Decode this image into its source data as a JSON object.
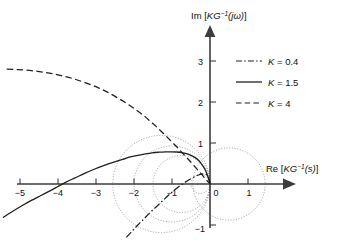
{
  "figure": {
    "name": "inverse-nyquist-plot",
    "background": "#ffffff",
    "ink": "#1a1a1a",
    "grid_color": "#8a8a8a"
  },
  "axes": {
    "x_label_parts": {
      "prefix": "Re [",
      "sym": "KG",
      "exp": "−1",
      "arg": "(s)",
      "suffix": "]"
    },
    "y_label_parts": {
      "prefix": "Im [",
      "sym": "KG",
      "exp": "−1",
      "arg": "(jω)",
      "suffix": "]"
    },
    "x_label": "Re [KG⁻¹(s)]",
    "y_label": "Im [KG⁻¹(jω)]",
    "x_ticks": [
      {
        "value": -5,
        "label": "−5"
      },
      {
        "value": -4,
        "label": "−4"
      },
      {
        "value": -3,
        "label": "−3"
      },
      {
        "value": -2,
        "label": "−2"
      },
      {
        "value": -1,
        "label": "−1"
      },
      {
        "value": 0,
        "label": "0"
      },
      {
        "value": 1,
        "label": "1"
      }
    ],
    "y_ticks": [
      {
        "value": 3,
        "label": "3"
      },
      {
        "value": 2,
        "label": "2"
      },
      {
        "value": 1,
        "label": "1"
      },
      {
        "value": -1,
        "label": "−1"
      }
    ],
    "xlim": [
      -5.6,
      1.9
    ],
    "ylim": [
      -1.45,
      3.55
    ],
    "origin_px": {
      "x": 210,
      "y": 184
    },
    "scale_px": {
      "x": 38.0,
      "y": 41.0
    }
  },
  "legend": {
    "position": "upper-right",
    "entries": [
      {
        "key": "K",
        "eq": " = ",
        "value": "0.4",
        "label": "K = 0.4",
        "style": "dash-dot"
      },
      {
        "key": "K",
        "eq": " = ",
        "value": "1.5",
        "label": "K = 1.5",
        "style": "solid"
      },
      {
        "key": "K",
        "eq": " = ",
        "value": "4",
        "label": "K = 4",
        "style": "dashed"
      }
    ]
  },
  "chart_data": {
    "type": "line",
    "title": "",
    "xlabel": "Re [KG⁻¹(s)]",
    "ylabel": "Im [KG⁻¹(jω)]",
    "xlim": [
      -5.6,
      1.9
    ],
    "ylim": [
      -1.45,
      3.55
    ],
    "grid": false,
    "legend_position": "upper-right",
    "series": [
      {
        "name": "K = 0.4",
        "style": "dash-dot",
        "color": "#1f1f1f",
        "points": [
          [
            -2.2,
            -1.3
          ],
          [
            -2.05,
            -1.15
          ],
          [
            -1.9,
            -1.0
          ],
          [
            -1.74,
            -0.85
          ],
          [
            -1.58,
            -0.7
          ],
          [
            -1.42,
            -0.56
          ],
          [
            -1.26,
            -0.42
          ],
          [
            -1.1,
            -0.28
          ],
          [
            -0.95,
            -0.16
          ],
          [
            -0.8,
            -0.05
          ],
          [
            -0.66,
            0.04
          ],
          [
            -0.52,
            0.12
          ],
          [
            -0.4,
            0.18
          ],
          [
            -0.3,
            0.22
          ],
          [
            -0.22,
            0.24
          ],
          [
            -0.15,
            0.245
          ],
          [
            -0.1,
            0.235
          ],
          [
            -0.06,
            0.2
          ],
          [
            -0.035,
            0.15
          ],
          [
            -0.018,
            0.09
          ],
          [
            -0.006,
            0.04
          ],
          [
            0.0,
            0.0
          ]
        ]
      },
      {
        "name": "K = 1.5",
        "style": "solid",
        "color": "#1f1f1f",
        "points": [
          [
            -5.45,
            -0.82
          ],
          [
            -5.2,
            -0.67
          ],
          [
            -4.95,
            -0.53
          ],
          [
            -4.7,
            -0.4
          ],
          [
            -4.45,
            -0.28
          ],
          [
            -4.2,
            -0.16
          ],
          [
            -4.0,
            -0.06
          ],
          [
            -3.8,
            0.04
          ],
          [
            -3.55,
            0.15
          ],
          [
            -3.3,
            0.26
          ],
          [
            -3.05,
            0.36
          ],
          [
            -2.8,
            0.45
          ],
          [
            -2.55,
            0.53
          ],
          [
            -2.3,
            0.6
          ],
          [
            -2.1,
            0.66
          ],
          [
            -1.9,
            0.7
          ],
          [
            -1.7,
            0.735
          ],
          [
            -1.52,
            0.76
          ],
          [
            -1.35,
            0.775
          ],
          [
            -1.18,
            0.785
          ],
          [
            -1.02,
            0.785
          ],
          [
            -0.88,
            0.78
          ],
          [
            -0.74,
            0.765
          ],
          [
            -0.62,
            0.74
          ],
          [
            -0.5,
            0.7
          ],
          [
            -0.4,
            0.65
          ],
          [
            -0.31,
            0.585
          ],
          [
            -0.24,
            0.51
          ],
          [
            -0.18,
            0.43
          ],
          [
            -0.13,
            0.35
          ],
          [
            -0.09,
            0.27
          ],
          [
            -0.06,
            0.19
          ],
          [
            -0.035,
            0.12
          ],
          [
            -0.018,
            0.065
          ],
          [
            -0.006,
            0.025
          ],
          [
            0.0,
            0.0
          ]
        ]
      },
      {
        "name": "K = 4",
        "style": "dashed",
        "color": "#1f1f1f",
        "points": [
          [
            -5.35,
            2.8
          ],
          [
            -5.05,
            2.79
          ],
          [
            -4.75,
            2.77
          ],
          [
            -4.45,
            2.735
          ],
          [
            -4.15,
            2.69
          ],
          [
            -3.85,
            2.63
          ],
          [
            -3.55,
            2.555
          ],
          [
            -3.25,
            2.46
          ],
          [
            -2.95,
            2.35
          ],
          [
            -2.7,
            2.24
          ],
          [
            -2.45,
            2.11
          ],
          [
            -2.2,
            1.97
          ],
          [
            -1.98,
            1.83
          ],
          [
            -1.76,
            1.68
          ],
          [
            -1.56,
            1.52
          ],
          [
            -1.38,
            1.37
          ],
          [
            -1.2,
            1.21
          ],
          [
            -1.04,
            1.06
          ],
          [
            -0.89,
            0.92
          ],
          [
            -0.75,
            0.78
          ],
          [
            -0.62,
            0.65
          ],
          [
            -0.5,
            0.53
          ],
          [
            -0.4,
            0.425
          ],
          [
            -0.31,
            0.33
          ],
          [
            -0.23,
            0.245
          ],
          [
            -0.165,
            0.175
          ],
          [
            -0.11,
            0.115
          ],
          [
            -0.065,
            0.068
          ],
          [
            -0.03,
            0.032
          ],
          [
            -0.01,
            0.011
          ],
          [
            0.0,
            0.0
          ]
        ]
      }
    ],
    "annotations": {
      "m_circles": [
        {
          "center": [
            -0.25,
            0.0
          ],
          "radius": 0.25
        },
        {
          "center": [
            -0.75,
            0.0
          ],
          "radius": 0.75
        },
        {
          "center": [
            -1.0,
            0.0
          ],
          "radius": 1.0
        },
        {
          "center": [
            -1.28,
            0.0
          ],
          "radius": 1.28
        },
        {
          "center": [
            0.5,
            0.0
          ],
          "radius": 0.95
        }
      ],
      "m_circle_style": "dotted",
      "note": "Dotted constant-magnitude (M) circles tangent to the imaginary axis at the origin"
    }
  }
}
